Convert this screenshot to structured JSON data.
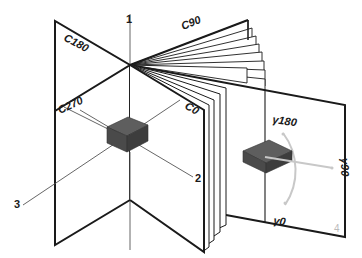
{
  "diagram": {
    "planes": {
      "c0": "C0",
      "c90": "C90",
      "c180": "C180",
      "c270": "C270"
    },
    "gamma_angles": {
      "g0": "γ0",
      "g90": "γ90",
      "g180": "γ180"
    },
    "axes": {
      "axis1": "1",
      "axis2": "2",
      "axis3": "3"
    },
    "page_number": "4",
    "colors": {
      "line": "#1a1a1a",
      "thin_line": "#555555",
      "box_top": "#5e5e5e",
      "box_front": "#4a4a4a",
      "box_side": "#3d3d3d",
      "arc": "#c8c8c8",
      "page_fill": "#ffffff"
    }
  }
}
